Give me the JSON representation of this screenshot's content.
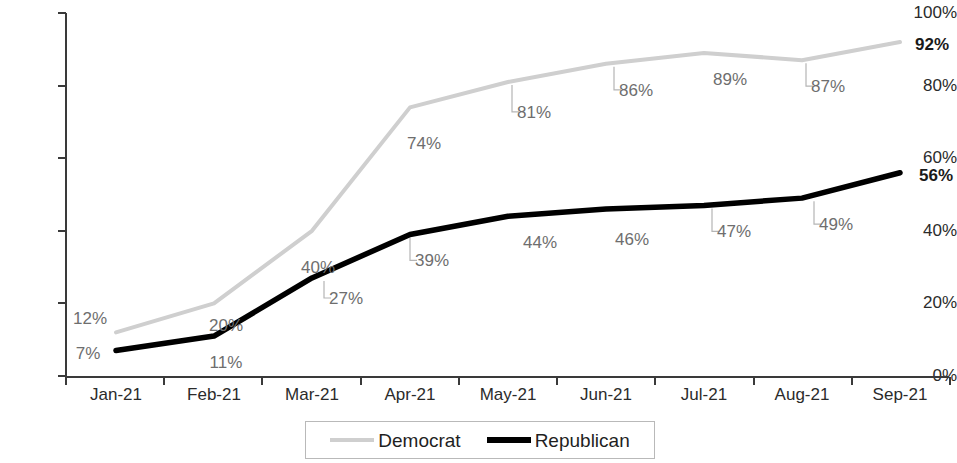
{
  "chart_data": {
    "type": "line",
    "title": "",
    "subtitle": "",
    "xlabel": "",
    "ylabel": "",
    "categories": [
      "Jan-21",
      "Feb-21",
      "Mar-21",
      "Apr-21",
      "May-21",
      "Jun-21",
      "Jul-21",
      "Aug-21",
      "Sep-21"
    ],
    "series": [
      {
        "name": "Democrat",
        "color": "#cfcfcf",
        "values": [
          12,
          20,
          40,
          74,
          81,
          86,
          89,
          87,
          92
        ],
        "labels": [
          "12%",
          "20%",
          "40%",
          "74%",
          "81%",
          "86%",
          "89%",
          "87%",
          "92%"
        ]
      },
      {
        "name": "Republican",
        "color": "#000000",
        "values": [
          7,
          11,
          27,
          39,
          44,
          46,
          47,
          49,
          56
        ],
        "labels": [
          "7%",
          "11%",
          "27%",
          "39%",
          "44%",
          "46%",
          "47%",
          "49%",
          "56%"
        ]
      }
    ],
    "ylim": [
      0,
      100
    ],
    "y_ticks": [
      0,
      20,
      40,
      60,
      80,
      100
    ],
    "y_tick_labels": [
      "0%",
      "20%",
      "40%",
      "60%",
      "80%",
      "100%"
    ],
    "grid": false,
    "legend_position": "bottom",
    "legend_entries": [
      "Democrat",
      "Republican"
    ]
  },
  "legend": {
    "democrat_label": "Democrat",
    "republican_label": "Republican"
  }
}
